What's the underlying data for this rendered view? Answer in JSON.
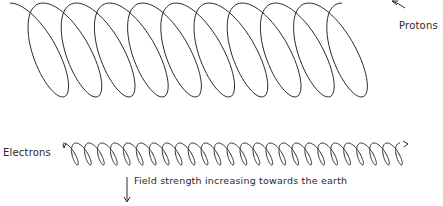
{
  "labels": {
    "protons": "Protons",
    "electrons": "Electrons",
    "field": "Field strength increasing towards the earth"
  },
  "helices": {
    "protons": {
      "x_start": 10,
      "x_end": 378,
      "y_center": 50,
      "radius_y": 47,
      "radius_x": 36,
      "loops": 10
    },
    "electrons": {
      "x_start": 63,
      "x_end": 408,
      "y_center": 154,
      "radius_y": 11,
      "radius_x": 8,
      "loops": 26
    }
  },
  "colors": {
    "stroke": "#2a2a2a",
    "background": "#ffffff"
  }
}
